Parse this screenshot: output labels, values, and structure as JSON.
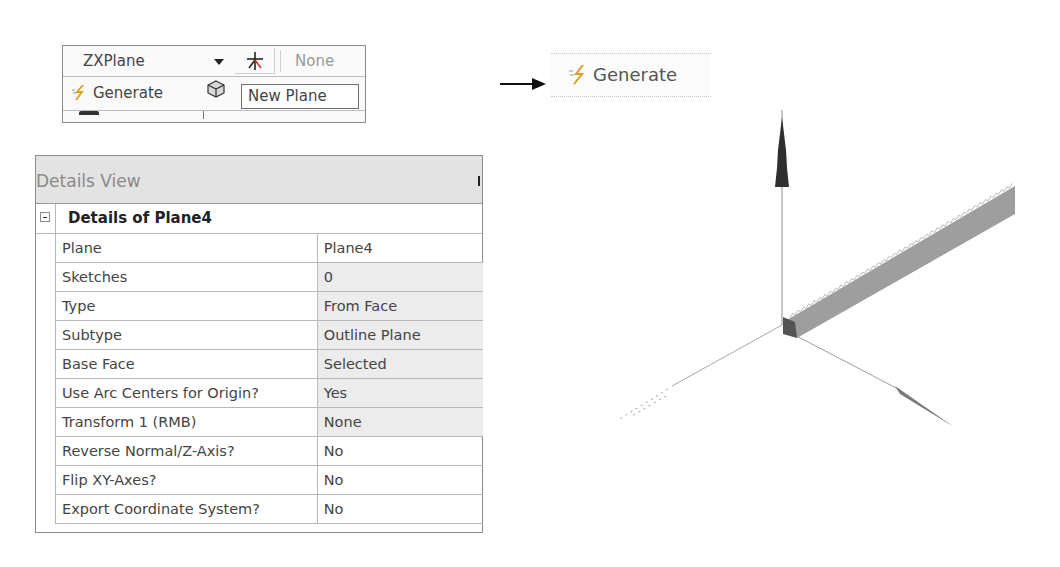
{
  "toolbar": {
    "plane_select": {
      "value": "ZXPlane"
    },
    "new_plane_icon": "asterisk-plane-icon",
    "sketch_field": {
      "value": "None"
    },
    "generate_button": {
      "label": "Generate",
      "icon": "lightning-generate-icon"
    },
    "tooltip": "New Plane"
  },
  "callout": {
    "generate_button": {
      "label": "Generate",
      "icon": "lightning-generate-icon"
    }
  },
  "details_view": {
    "title": "Details View",
    "section_title": "Details of Plane4",
    "rows": [
      {
        "label": "Plane",
        "value": "Plane4",
        "shaded": false
      },
      {
        "label": "Sketches",
        "value": "0",
        "shaded": true
      },
      {
        "label": "Type",
        "value": "From Face",
        "shaded": true
      },
      {
        "label": "Subtype",
        "value": "Outline Plane",
        "shaded": true
      },
      {
        "label": "Base Face",
        "value": "Selected",
        "shaded": true
      },
      {
        "label": "Use Arc Centers for Origin?",
        "value": "Yes",
        "shaded": true
      },
      {
        "label": "Transform 1 (RMB)",
        "value": "None",
        "shaded": true
      },
      {
        "label": "Reverse Normal/Z-Axis?",
        "value": "No",
        "shaded": false
      },
      {
        "label": "Flip XY-Axes?",
        "value": "No",
        "shaded": false
      },
      {
        "label": "Export Coordinate System?",
        "value": "No",
        "shaded": false
      }
    ]
  },
  "viewport": {
    "axis_colors": {
      "vertical": "#2f2f2f",
      "right": "#7a7a7a",
      "line": "#9a9a9a"
    },
    "rack_color": "#9e9e9e"
  }
}
